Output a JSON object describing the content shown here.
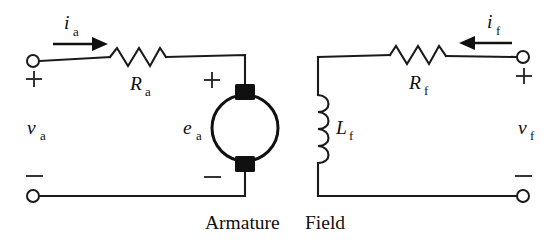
{
  "figure": {
    "type": "circuit-schematic",
    "title": "",
    "background_color": "#ffffff",
    "line_color": "#101010"
  },
  "armature": {
    "caption": "Armature",
    "source_label": "v",
    "source_sub": "a",
    "current_label": "i",
    "current_sub": "a",
    "current_direction": "right",
    "resistor_label": "R",
    "resistor_sub": "a",
    "emf_label": "e",
    "emf_sub": "a",
    "terminal_plus": "+",
    "terminal_minus": "−",
    "emf_plus": "+",
    "emf_minus": "−",
    "components": [
      "resistor",
      "dc-machine"
    ]
  },
  "field": {
    "caption": "Field",
    "source_label": "v",
    "source_sub": "f",
    "current_label": "i",
    "current_sub": "f",
    "current_direction": "left",
    "resistor_label": "R",
    "resistor_sub": "f",
    "inductor_label": "L",
    "inductor_sub": "f",
    "terminal_plus": "+",
    "terminal_minus": "−",
    "components": [
      "resistor",
      "inductor"
    ]
  }
}
